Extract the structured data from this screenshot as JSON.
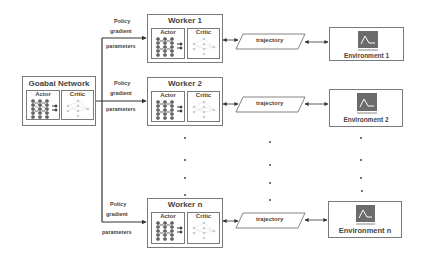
{
  "global_network": {
    "title": "Goabal Network",
    "actor_label": "Actor",
    "critic_label": "Critic"
  },
  "edge_labels": {
    "policy": "Policy",
    "gradient": "gradient",
    "parameters": "parameters"
  },
  "workers": [
    {
      "title": "Worker 1",
      "actor_label": "Actor",
      "critic_label": "Critic",
      "trajectory_label": "trajectory",
      "environment_label": "Environment 1"
    },
    {
      "title": "Worker 2",
      "actor_label": "Actor",
      "critic_label": "Critic",
      "trajectory_label": "trajectory",
      "environment_label": "Environment 2"
    },
    {
      "title": "Worker n",
      "actor_label": "Actor",
      "critic_label": "Critic",
      "trajectory_label": "trajectory",
      "environment_label": "Environment n"
    }
  ],
  "colors": {
    "stroke": "#555555",
    "box_border": "#7a7a7a",
    "env_icon": "#6b6b6b",
    "actor_net": "#555555",
    "critic_net": "#bbbbbb"
  }
}
